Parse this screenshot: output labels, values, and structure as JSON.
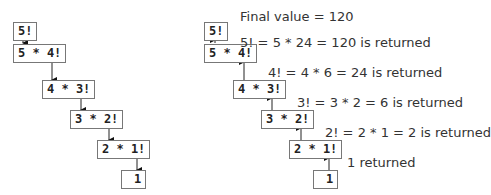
{
  "left_diagram": {
    "title": "Recursive calls",
    "boxes": [
      "5!",
      "5 * 4!",
      "4 * 3!",
      "3 * 2!",
      "2 * 1!",
      "1"
    ]
  },
  "right_diagram": {
    "title": "Values returned",
    "boxes": [
      "5!",
      "5 * 4!",
      "4 * 3!",
      "3 * 2!",
      "2 * 1!",
      "1"
    ],
    "labels": [
      "Final value = 120",
      "5! = 5 * 24 = 120 is returned",
      "4! = 4 * 6 = 24 is returned",
      "3! = 3 * 2 = 6 is returned",
      "2! = 2 * 1 = 2 is returned",
      "1 returned"
    ]
  },
  "colors": {
    "border": "#777777",
    "text": "#222222",
    "arrow": "#111111"
  }
}
